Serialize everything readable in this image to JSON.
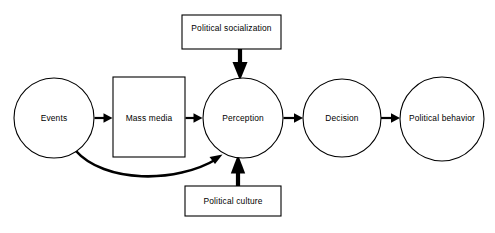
{
  "diagram": {
    "background_color": "#ffffff",
    "stroke_color": "#000000",
    "fill_color": "#ffffff",
    "nodes": [
      {
        "id": "events",
        "label": "Events",
        "shape": "circle",
        "cx": 54,
        "cy": 118,
        "r": 40
      },
      {
        "id": "mass-media",
        "label": "Mass media",
        "shape": "rect",
        "x": 113,
        "y": 77,
        "width": 72,
        "height": 80,
        "cx": 149,
        "cy": 118
      },
      {
        "id": "perception",
        "label": "Perception",
        "shape": "circle",
        "cx": 243,
        "cy": 118,
        "r": 40
      },
      {
        "id": "decision",
        "label": "Decision",
        "shape": "circle",
        "cx": 342,
        "cy": 118,
        "r": 39
      },
      {
        "id": "political-behavior",
        "label": "Political behavior",
        "shape": "circle",
        "cx": 442,
        "cy": 119,
        "r": 42
      },
      {
        "id": "political-socialization",
        "label": "Political socialization",
        "shape": "rect",
        "x": 182,
        "y": 15,
        "width": 99,
        "height": 34,
        "cx": 231,
        "cy": 30
      },
      {
        "id": "political-culture",
        "label": "Political culture",
        "shape": "rect",
        "x": 185,
        "y": 186,
        "width": 96,
        "height": 30,
        "cx": 233,
        "cy": 201
      }
    ],
    "edges": [
      {
        "id": "events-to-mass-media",
        "from": "events",
        "to": "mass-media",
        "kind": "straight-right"
      },
      {
        "id": "mass-media-to-perception",
        "from": "mass-media",
        "to": "perception",
        "kind": "straight-right"
      },
      {
        "id": "perception-to-decision",
        "from": "perception",
        "to": "decision",
        "kind": "straight-right"
      },
      {
        "id": "decision-to-political-behavior",
        "from": "decision",
        "to": "political-behavior",
        "kind": "straight-right"
      },
      {
        "id": "socialization-to-perception",
        "from": "political-socialization",
        "to": "perception",
        "kind": "straight-down"
      },
      {
        "id": "culture-to-perception",
        "from": "political-culture",
        "to": "perception",
        "kind": "straight-up"
      },
      {
        "id": "events-to-perception",
        "from": "events",
        "to": "perception",
        "kind": "curved"
      }
    ]
  }
}
